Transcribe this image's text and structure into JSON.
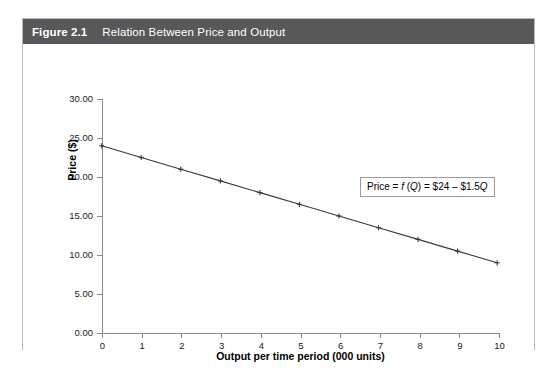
{
  "figure": {
    "number": "Figure 2.1",
    "caption": "Relation Between Price and Output"
  },
  "colors": {
    "header_bar": "#58585a",
    "header_text": "#ffffff",
    "card_border": "#b9b9b9",
    "axis": "#8a8a8a",
    "series_line": "#3a3a3a",
    "annotation_border": "#9a9a9a",
    "plot_background": "#ffffff"
  },
  "annotation": {
    "prefix": "Price = ",
    "f_symbol": "f",
    "open_paren": " (",
    "q_symbol_1": "Q",
    "close_paren": ") = $24 – $1.5",
    "q_symbol_2": "Q"
  },
  "chart_data": {
    "type": "line",
    "title": "Relation Between Price and Output",
    "subtitle": "",
    "xlabel": "Output per time period (000 units)",
    "ylabel": "Price ($)",
    "x": [
      0,
      1,
      2,
      3,
      4,
      5,
      6,
      7,
      8,
      9,
      10
    ],
    "xtick_labels": [
      "0",
      "1",
      "2",
      "3",
      "4",
      "5",
      "6",
      "7",
      "8",
      "9",
      "10"
    ],
    "ytick_values": [
      0,
      5,
      10,
      15,
      20,
      25,
      30
    ],
    "ytick_labels": [
      "0.00",
      "5.00",
      "10.00",
      "15.00",
      "20.00",
      "25.00",
      "30.00"
    ],
    "xlim": [
      0,
      10
    ],
    "ylim": [
      0,
      30
    ],
    "grid": false,
    "legend": "none",
    "marker": "plus",
    "annotations": [
      "Price = f (Q) = $24 – $1.5Q"
    ],
    "series": [
      {
        "name": "Price = f(Q) = $24 - $1.5Q",
        "values": [
          24,
          22.5,
          21,
          19.5,
          18,
          16.5,
          15,
          13.5,
          12,
          10.5,
          9
        ]
      }
    ]
  }
}
